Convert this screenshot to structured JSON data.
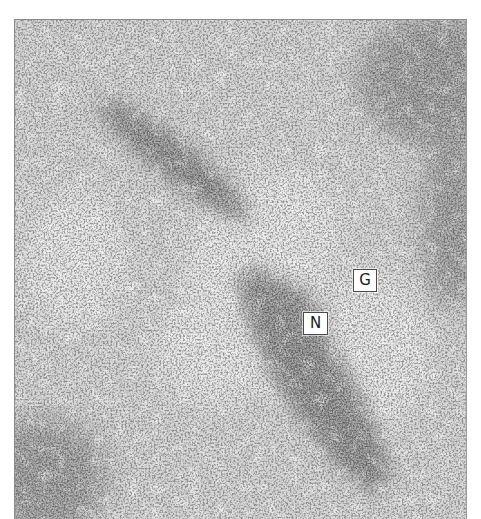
{
  "figure": {
    "type": "grayscale histology micrograph",
    "labels": [
      {
        "id": "G",
        "text": "G",
        "x": 352,
        "y": 268,
        "w": 24,
        "h": 23
      },
      {
        "id": "N",
        "text": "N",
        "x": 302,
        "y": 311,
        "w": 25,
        "h": 23
      }
    ],
    "colors": {
      "background": "#d4d4d4",
      "dark_band": "#9c9c9c",
      "cell_nuclei": "#5a5a5a",
      "label_bg": "#ffffff",
      "label_border": "#4a4a4a",
      "label_text": "#1a1a1a"
    }
  }
}
